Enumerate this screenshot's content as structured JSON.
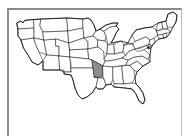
{
  "figure": {
    "kind": "choropleth-locator-map",
    "title": "Map of the United States with Arkansas highlighted",
    "region": "Contiguous United States",
    "projection_note": "simplified outline",
    "background_color": "#ffffff",
    "frame": {
      "visible": true,
      "color": "#8c8c8c",
      "style": "thin rectangle, bottom edge cropped"
    },
    "map_style": {
      "state_fill": "#ffffff",
      "state_border_color": "#1a1a1a",
      "nation_border_color": "#111111",
      "highlight_fill": "#8d8d8d",
      "highlight_border_color": "#1a1a1a"
    },
    "legend": {
      "visible": false,
      "entries": []
    },
    "labels": {
      "visible": false,
      "text": ""
    },
    "highlighted": {
      "name": "Arkansas",
      "abbreviation": "AR",
      "fill": "#8d8d8d",
      "count": 1
    },
    "marker": {
      "visible": true,
      "name": "chesapeake-mark",
      "color": "#3a3a3a"
    },
    "states_drawn": [
      "Washington",
      "Oregon",
      "California",
      "Idaho",
      "Nevada",
      "Utah",
      "Arizona",
      "Montana",
      "Wyoming",
      "Colorado",
      "New Mexico",
      "North Dakota",
      "South Dakota",
      "Nebraska",
      "Kansas",
      "Oklahoma",
      "Texas",
      "Minnesota",
      "Iowa",
      "Missouri",
      "Arkansas",
      "Louisiana",
      "Wisconsin",
      "Illinois",
      "Michigan",
      "Indiana",
      "Ohio",
      "Kentucky",
      "Tennessee",
      "Mississippi",
      "Alabama",
      "Georgia",
      "Florida",
      "South Carolina",
      "North Carolina",
      "Virginia",
      "West Virginia",
      "Maryland",
      "Delaware",
      "Pennsylvania",
      "New Jersey",
      "New York",
      "Connecticut",
      "Rhode Island",
      "Massachusetts",
      "Vermont",
      "New Hampshire",
      "Maine"
    ],
    "state_count": 48
  }
}
